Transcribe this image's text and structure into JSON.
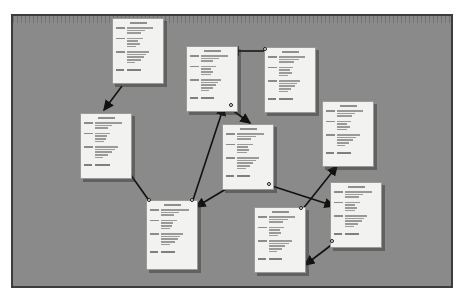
{
  "canvas": {
    "background_color": "#8a8a8a",
    "border_color": "#3c3c3c",
    "ruler_label": "horizontal ruler",
    "zoom_note": "zoomed-out view"
  },
  "cards": [
    {
      "id": "card-1",
      "name": "note-card-top-left",
      "title": "",
      "x": 112,
      "y": 18,
      "w": 52,
      "h": 66,
      "groups": [
        {
          "label_w": 9,
          "lines": [
            26,
            18,
            14
          ]
        },
        {
          "label_w": 9,
          "lines": [
            16,
            11,
            13,
            9
          ]
        },
        {
          "label_w": 9,
          "lines": [
            22,
            19,
            17,
            14,
            8
          ]
        }
      ],
      "footer": [
        8,
        14
      ]
    },
    {
      "id": "card-2",
      "name": "note-card-top-center",
      "title": "",
      "x": 186,
      "y": 46,
      "w": 52,
      "h": 66,
      "groups": [
        {
          "label_w": 9,
          "lines": [
            27,
            18,
            12
          ]
        },
        {
          "label_w": 9,
          "lines": [
            15,
            10,
            12,
            10
          ]
        },
        {
          "label_w": 9,
          "lines": [
            20,
            17,
            15,
            12,
            8
          ]
        }
      ],
      "footer": [
        8,
        13
      ]
    },
    {
      "id": "card-3",
      "name": "note-card-top-right",
      "title": "",
      "x": 264,
      "y": 47,
      "w": 52,
      "h": 66,
      "groups": [
        {
          "label_w": 9,
          "lines": [
            26,
            20,
            15
          ]
        },
        {
          "label_w": 9,
          "lines": [
            14,
            11,
            13,
            9
          ]
        },
        {
          "label_w": 9,
          "lines": [
            21,
            18,
            16,
            12,
            9
          ]
        }
      ],
      "footer": [
        8,
        14
      ]
    },
    {
      "id": "card-4",
      "name": "note-card-left",
      "title": "",
      "x": 80,
      "y": 113,
      "w": 52,
      "h": 66,
      "groups": [
        {
          "label_w": 9,
          "lines": [
            27,
            17,
            13
          ]
        },
        {
          "label_w": 9,
          "lines": [
            15,
            12,
            11,
            9
          ]
        },
        {
          "label_w": 9,
          "lines": [
            23,
            20,
            17,
            13,
            8
          ]
        }
      ],
      "footer": [
        8,
        15
      ]
    },
    {
      "id": "card-5",
      "name": "note-card-center",
      "title": "",
      "x": 222,
      "y": 124,
      "w": 52,
      "h": 66,
      "groups": [
        {
          "label_w": 9,
          "lines": [
            27,
            19,
            14
          ]
        },
        {
          "label_w": 9,
          "lines": [
            16,
            11,
            12,
            10
          ]
        },
        {
          "label_w": 9,
          "lines": [
            22,
            19,
            16,
            13,
            9
          ]
        }
      ],
      "footer": [
        8,
        13
      ]
    },
    {
      "id": "card-6",
      "name": "note-card-right",
      "title": "",
      "x": 322,
      "y": 101,
      "w": 52,
      "h": 66,
      "groups": [
        {
          "label_w": 9,
          "lines": [
            26,
            18,
            15
          ]
        },
        {
          "label_w": 9,
          "lines": [
            14,
            10,
            13,
            10
          ]
        },
        {
          "label_w": 9,
          "lines": [
            23,
            19,
            16,
            12,
            8
          ]
        }
      ],
      "footer": [
        8,
        14
      ]
    },
    {
      "id": "card-7",
      "name": "note-card-bottom-left",
      "title": "",
      "x": 146,
      "y": 200,
      "w": 52,
      "h": 70,
      "groups": [
        {
          "label_w": 9,
          "lines": [
            28,
            18,
            13
          ]
        },
        {
          "label_w": 9,
          "lines": [
            16,
            12,
            11,
            9
          ]
        },
        {
          "label_w": 9,
          "lines": [
            22,
            19,
            17,
            14,
            9
          ]
        }
      ],
      "footer": [
        8,
        14
      ]
    },
    {
      "id": "card-8",
      "name": "note-card-bottom-center",
      "title": "",
      "x": 254,
      "y": 207,
      "w": 52,
      "h": 66,
      "groups": [
        {
          "label_w": 9,
          "lines": [
            26,
            19,
            14
          ]
        },
        {
          "label_w": 9,
          "lines": [
            15,
            11,
            12,
            9
          ]
        },
        {
          "label_w": 9,
          "lines": [
            23,
            20,
            16,
            13,
            8
          ]
        }
      ],
      "footer": [
        8,
        13
      ]
    },
    {
      "id": "card-9",
      "name": "note-card-bottom-right",
      "title": "",
      "x": 330,
      "y": 182,
      "w": 52,
      "h": 66,
      "groups": [
        {
          "label_w": 9,
          "lines": [
            27,
            18,
            14
          ]
        },
        {
          "label_w": 9,
          "lines": [
            15,
            10,
            12,
            10
          ]
        },
        {
          "label_w": 9,
          "lines": [
            22,
            19,
            17,
            13,
            9
          ]
        }
      ],
      "footer": [
        8,
        14
      ]
    }
  ],
  "connections": [
    {
      "name": "connector-card1-to-card4",
      "from": "card-1",
      "to": "card-4",
      "x1": 122,
      "y1": 86,
      "x2": 104,
      "y2": 110,
      "arrow_start": false,
      "arrow_end": true
    },
    {
      "name": "connector-card3-to-card2",
      "from": "card-3",
      "to": "card-2",
      "x1": 266,
      "y1": 51,
      "x2": 229,
      "y2": 51,
      "arrow_start": false,
      "arrow_end": true
    },
    {
      "name": "connector-card2-to-card5",
      "from": "card-2",
      "to": "card-5",
      "x1": 228,
      "y1": 107,
      "x2": 250,
      "y2": 123,
      "arrow_start": false,
      "arrow_end": true
    },
    {
      "name": "connector-card7-to-card2",
      "from": "card-7",
      "to": "card-2",
      "x1": 192,
      "y1": 203,
      "x2": 224,
      "y2": 106,
      "arrow_start": false,
      "arrow_end": true
    },
    {
      "name": "connector-card7-to-card4",
      "from": "card-7",
      "to": "card-4",
      "x1": 150,
      "y1": 202,
      "x2": 121,
      "y2": 161,
      "arrow_start": false,
      "arrow_end": true
    },
    {
      "name": "connector-card5-to-card7",
      "from": "card-5",
      "to": "card-7",
      "x1": 231,
      "y1": 186,
      "x2": 196,
      "y2": 207,
      "arrow_start": false,
      "arrow_end": true
    },
    {
      "name": "connector-card5-to-card9",
      "from": "card-5",
      "to": "card-9",
      "x1": 272,
      "y1": 186,
      "x2": 334,
      "y2": 206,
      "arrow_start": false,
      "arrow_end": true
    },
    {
      "name": "connector-card8-to-card6",
      "from": "card-8",
      "to": "card-6",
      "x1": 302,
      "y1": 210,
      "x2": 337,
      "y2": 166,
      "arrow_start": false,
      "arrow_end": true
    },
    {
      "name": "connector-card9-to-card8",
      "from": "card-9",
      "to": "card-8",
      "x1": 334,
      "y1": 243,
      "x2": 305,
      "y2": 265,
      "arrow_start": false,
      "arrow_end": true
    }
  ],
  "handles": [
    {
      "name": "connection-handle-card2-bottom",
      "x": 231,
      "y": 105
    },
    {
      "name": "connection-handle-card3-left",
      "x": 265,
      "y": 49
    },
    {
      "name": "connection-handle-card5-bottom",
      "x": 269,
      "y": 184
    },
    {
      "name": "connection-handle-card7-topleft",
      "x": 149,
      "y": 200
    },
    {
      "name": "connection-handle-card7-topright",
      "x": 192,
      "y": 200
    },
    {
      "name": "connection-handle-card8-topright",
      "x": 301,
      "y": 208
    },
    {
      "name": "connection-handle-card9-bottomleft",
      "x": 332,
      "y": 241
    }
  ]
}
